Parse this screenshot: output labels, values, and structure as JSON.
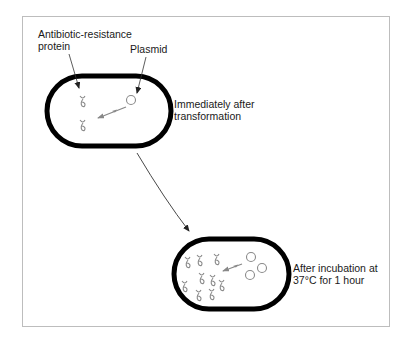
{
  "diagram": {
    "labels": {
      "protein": [
        "Antibiotic-resistance",
        "protein"
      ],
      "plasmid": "Plasmid"
    },
    "stages": [
      {
        "name": "immediately-after-transformation",
        "caption": [
          "Immediately after",
          "transformation"
        ],
        "proteins": 2,
        "plasmids": 1
      },
      {
        "name": "after-incubation",
        "caption": [
          "After incubation at",
          "37°C for 1 hour"
        ],
        "proteins": 9,
        "plasmids": 3
      }
    ],
    "colors": {
      "cell_outline": "#000000",
      "content_stroke": "#8a8a8a",
      "frame_border": "#bdbdbd",
      "text": "#1a1a1a"
    }
  }
}
